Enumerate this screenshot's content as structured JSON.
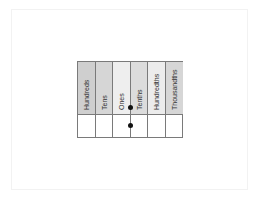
{
  "diagram": {
    "title": "",
    "type": "place-value-chart",
    "columns": [
      {
        "label": "Hundreds",
        "header_color": "#cfcfcf"
      },
      {
        "label": "Tens",
        "header_color": "#d6d6d6"
      },
      {
        "label": "Ones",
        "header_color": "#eeeeee"
      },
      {
        "label": "Tenths",
        "header_color": "#dcdcdc"
      },
      {
        "label": "Hundredths",
        "header_color": "#ececec"
      },
      {
        "label": "Thousandths",
        "header_color": "#d6d6d6"
      }
    ],
    "decimal_point_dots": [
      {
        "between": [
          "Ones",
          "Tenths"
        ],
        "row": "header"
      },
      {
        "between": [
          "Ones",
          "Tenths"
        ],
        "row": "body"
      }
    ],
    "body_row_values": [
      "",
      "",
      "",
      "",
      "",
      ""
    ],
    "colors": {
      "border": "#7a7a7a",
      "dot": "#111111",
      "text": "#333333",
      "frame": "#f2f2f2"
    }
  }
}
